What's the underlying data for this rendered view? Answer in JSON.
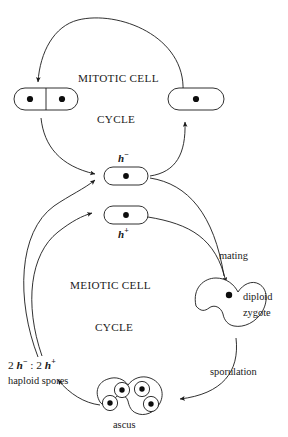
{
  "diagram": {
    "title_mitotic_line1": "MITOTIC CELL",
    "title_mitotic_line2": "CYCLE",
    "title_meiotic_line1": "MEIOTIC CELL",
    "title_meiotic_line2": "CYCLE",
    "label_h_minus_base": "h",
    "label_h_minus_sign": "−",
    "label_h_plus_base": "h",
    "label_h_plus_sign": "+",
    "label_mating": "mating",
    "label_sporulation": "sporulation",
    "label_diploid_line1": "diploid",
    "label_diploid_line2": "zygote",
    "label_ascus": "ascus",
    "label_spores_ratio_prefix": "2 ",
    "label_spores_ratio_mid": " : 2 ",
    "label_spores_line2": "haploid  spores",
    "ink_color": "#1a1a1a",
    "background_color": "#ffffff"
  },
  "nodes": [
    {
      "id": "dividing-cell",
      "kind": "two-compartment-cell",
      "nuclei": 2,
      "cycle": "mitotic"
    },
    {
      "id": "single-cell",
      "kind": "one-compartment-cell",
      "nuclei": 1,
      "cycle": "mitotic"
    },
    {
      "id": "h-minus-cell",
      "kind": "one-compartment-cell",
      "nuclei": 1,
      "mating_type": "h-minus"
    },
    {
      "id": "h-plus-cell",
      "kind": "one-compartment-cell",
      "nuclei": 1,
      "mating_type": "h-plus"
    },
    {
      "id": "zygote",
      "kind": "kidney-shape",
      "nuclei": 1,
      "ploidy": "diploid"
    },
    {
      "id": "ascus",
      "kind": "kidney-shape",
      "spores": 4,
      "ploidy": "haploid"
    }
  ],
  "edges": [
    {
      "from": "single-cell",
      "to": "dividing-cell",
      "label": "",
      "shape": "top-arc"
    },
    {
      "from": "dividing-cell",
      "to": "h-minus-cell",
      "label": "",
      "shape": "left-curve"
    },
    {
      "from": "h-minus-cell",
      "to": "single-cell",
      "label": "",
      "shape": "right-curve"
    },
    {
      "from": "h-minus-cell",
      "to": "zygote",
      "label": "mating",
      "shape": "right-down-curve"
    },
    {
      "from": "h-plus-cell",
      "to": "zygote",
      "label": "mating",
      "shape": "right-down-curve"
    },
    {
      "from": "zygote",
      "to": "ascus",
      "label": "sporulation",
      "shape": "right-down-curve"
    },
    {
      "from": "ascus",
      "to": "haploid-spores",
      "label": "",
      "shape": "left-curve"
    },
    {
      "from": "haploid-spores",
      "to": "h-minus-cell",
      "label": "",
      "shape": "left-up-curve"
    },
    {
      "from": "haploid-spores",
      "to": "h-plus-cell",
      "label": "",
      "shape": "left-up-curve"
    }
  ]
}
